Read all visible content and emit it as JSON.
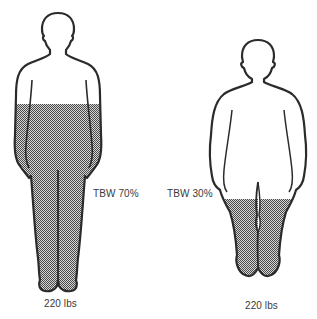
{
  "figures": [
    {
      "id": "lean",
      "tbw_label": "TBW 70%",
      "weight_label": "220 lbs",
      "tbw_percent": 70
    },
    {
      "id": "obese",
      "tbw_label": "TBW 30%",
      "weight_label": "220 lbs",
      "tbw_percent": 30
    }
  ],
  "colors": {
    "outline": "#2b2b2b",
    "shade_dark": "#555555",
    "shade_light": "#d8d8d8",
    "background": "#ffffff"
  }
}
